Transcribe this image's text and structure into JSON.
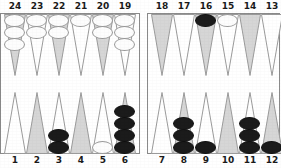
{
  "board": {
    "title": "Backgammon board position",
    "colors": {
      "triangle_shaded": "#d6d6d6",
      "triangle_plain": "#ffffff",
      "triangle_outline": "#9b9b9b",
      "checker_white": "#fdfdfd",
      "checker_black": "#1b1b1b",
      "frame_border": "#8a8a8a",
      "label_text": "#1a1a1a",
      "background": "#ffffff"
    },
    "top_labels": [
      "24",
      "23",
      "22",
      "21",
      "20",
      "19",
      "18",
      "17",
      "16",
      "15",
      "14",
      "13"
    ],
    "bottom_labels": [
      "1",
      "2",
      "3",
      "4",
      "5",
      "6",
      "7",
      "8",
      "9",
      "10",
      "11",
      "12"
    ],
    "points": [
      {
        "label": "24",
        "row": "top",
        "slot": 0,
        "shaded": true,
        "checkers": 3,
        "color": "white"
      },
      {
        "label": "23",
        "row": "top",
        "slot": 1,
        "shaded": false,
        "checkers": 2,
        "color": "white"
      },
      {
        "label": "22",
        "row": "top",
        "slot": 2,
        "shaded": true,
        "checkers": 2,
        "color": "white"
      },
      {
        "label": "21",
        "row": "top",
        "slot": 3,
        "shaded": false,
        "checkers": 1,
        "color": "white"
      },
      {
        "label": "20",
        "row": "top",
        "slot": 4,
        "shaded": true,
        "checkers": 2,
        "color": "white"
      },
      {
        "label": "19",
        "row": "top",
        "slot": 5,
        "shaded": false,
        "checkers": 3,
        "color": "white"
      },
      {
        "label": "18",
        "row": "top",
        "slot": 6,
        "shaded": true,
        "checkers": 0,
        "color": "none"
      },
      {
        "label": "17",
        "row": "top",
        "slot": 7,
        "shaded": false,
        "checkers": 0,
        "color": "none"
      },
      {
        "label": "16",
        "row": "top",
        "slot": 8,
        "shaded": true,
        "checkers": 1,
        "color": "black"
      },
      {
        "label": "15",
        "row": "top",
        "slot": 9,
        "shaded": false,
        "checkers": 1,
        "color": "white"
      },
      {
        "label": "14",
        "row": "top",
        "slot": 10,
        "shaded": true,
        "checkers": 0,
        "color": "none"
      },
      {
        "label": "13",
        "row": "top",
        "slot": 11,
        "shaded": false,
        "checkers": 0,
        "color": "none"
      },
      {
        "label": "1",
        "row": "bottom",
        "slot": 0,
        "shaded": false,
        "checkers": 0,
        "color": "none"
      },
      {
        "label": "2",
        "row": "bottom",
        "slot": 1,
        "shaded": true,
        "checkers": 0,
        "color": "none"
      },
      {
        "label": "3",
        "row": "bottom",
        "slot": 2,
        "shaded": false,
        "checkers": 2,
        "color": "black"
      },
      {
        "label": "4",
        "row": "bottom",
        "slot": 3,
        "shaded": true,
        "checkers": 0,
        "color": "none"
      },
      {
        "label": "5",
        "row": "bottom",
        "slot": 4,
        "shaded": false,
        "checkers": 1,
        "color": "white"
      },
      {
        "label": "6",
        "row": "bottom",
        "slot": 5,
        "shaded": true,
        "checkers": 4,
        "color": "black"
      },
      {
        "label": "7",
        "row": "bottom",
        "slot": 6,
        "shaded": false,
        "checkers": 0,
        "color": "none"
      },
      {
        "label": "8",
        "row": "bottom",
        "slot": 7,
        "shaded": true,
        "checkers": 3,
        "color": "black"
      },
      {
        "label": "9",
        "row": "bottom",
        "slot": 8,
        "shaded": false,
        "checkers": 1,
        "color": "black"
      },
      {
        "label": "10",
        "row": "bottom",
        "slot": 9,
        "shaded": true,
        "checkers": 0,
        "color": "none"
      },
      {
        "label": "11",
        "row": "bottom",
        "slot": 10,
        "shaded": false,
        "checkers": 3,
        "color": "black"
      },
      {
        "label": "12",
        "row": "bottom",
        "slot": 11,
        "shaded": true,
        "checkers": 1,
        "color": "black"
      }
    ]
  }
}
